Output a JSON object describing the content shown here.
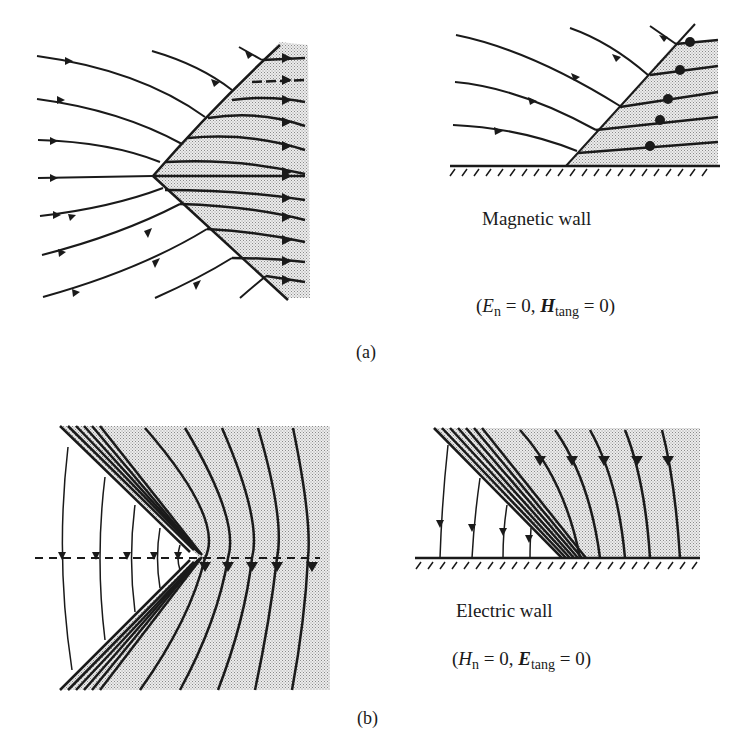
{
  "figure": {
    "part_a": {
      "panel_label": "(a)",
      "wall_label": "Magnetic wall",
      "condition": {
        "open": "(",
        "field1": "E",
        "field1_sub": "n",
        "eq1": " = 0, ",
        "field2": "H",
        "field2_sub": "tang",
        "eq2": " = 0)"
      },
      "left_diagram": "wedge-shaped shaded region with horizontal field lines (arrows pointing right) refracting at the boundary",
      "right_diagram": "half-plane above a hatched magnetic wall, field lines meeting the inclined boundary and continuing horizontally"
    },
    "part_b": {
      "panel_label": "(b)",
      "wall_label": "Electric wall",
      "condition": {
        "open": "(",
        "field1": "H",
        "field1_sub": "n",
        "eq1": " = 0, ",
        "field2": "E",
        "field2_sub": "tang",
        "eq2": " = 0)"
      },
      "left_diagram": "V-shaped region with dashed symmetry line, curved vertical field lines with downward arrows",
      "right_diagram": "half-plane above hatched electric wall, vertical field lines with downward arrows terminating on the wall"
    },
    "colors": {
      "ink": "#1a1a1a",
      "shade": "#d8d8d8",
      "background": "#ffffff"
    }
  }
}
